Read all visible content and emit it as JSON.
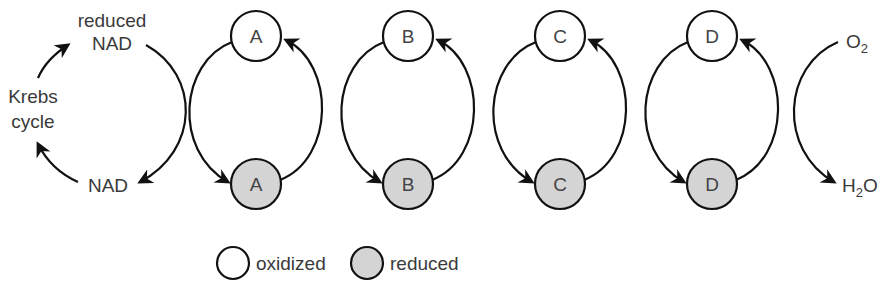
{
  "diagram": {
    "left": {
      "reduced_nad": [
        "reduced",
        "NAD"
      ],
      "nad": "NAD",
      "krebs": [
        "Krebs",
        "cycle"
      ]
    },
    "carriers": [
      {
        "label": "A",
        "x": 256
      },
      {
        "label": "B",
        "x": 408
      },
      {
        "label": "C",
        "x": 560
      },
      {
        "label": "D",
        "x": 712
      }
    ],
    "right": {
      "o2": "O",
      "o2_sub": "2",
      "h2o_h": "H",
      "h2o_sub": "2",
      "h2o_o": "O"
    },
    "legend": {
      "oxidized": "oxidized",
      "reduced": "reduced"
    },
    "colors": {
      "stroke": "#111111",
      "reduced_fill": "#d4d4d4",
      "oxidized_fill": "#ffffff",
      "text": "#3a3a3a"
    }
  }
}
